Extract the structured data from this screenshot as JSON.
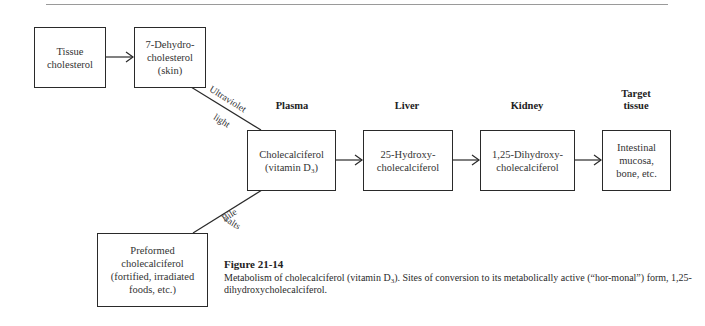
{
  "diagram": {
    "column_headers": {
      "plasma": "Plasma",
      "liver": "Liver",
      "kidney": "Kidney",
      "target_line1": "Target",
      "target_line2": "tissue"
    },
    "nodes": {
      "tissue_cholesterol": {
        "line1": "Tissue",
        "line2": "cholesterol"
      },
      "dehydrocholesterol": {
        "line1": "7-Dehydro-",
        "line2": "cholesterol",
        "line3": "(skin)"
      },
      "cholecalciferol": {
        "line1": "Cholecalciferol",
        "line2_pre": "(vitamin D",
        "line2_sub": "3",
        "line2_post": ")"
      },
      "hydroxy25": {
        "line1": "25-Hydroxy-",
        "line2": "cholecalciferol"
      },
      "dihydroxy125": {
        "line1": "1,25-Dihydroxy-",
        "line2": "cholecalciferol"
      },
      "target_tissue": {
        "line1": "Intestinal",
        "line2": "mucosa,",
        "line3": "bone, etc."
      },
      "preformed": {
        "line1": "Preformed",
        "line2": "cholecalciferol",
        "line3": "(fortified, irradiated",
        "line4": "foods, etc.)"
      }
    },
    "edge_labels": {
      "uv_line1": "Ultraviolet",
      "uv_line2": "light",
      "bile_line1": "Bile",
      "bile_line2": "salts"
    },
    "edges": [
      {
        "from": "tissue_cholesterol",
        "to": "dehydrocholesterol",
        "arrow": true
      },
      {
        "from": "dehydrocholesterol",
        "to": "cholecalciferol",
        "label": "Ultraviolet light",
        "arrow": false
      },
      {
        "from": "preformed",
        "to": "cholecalciferol",
        "label": "Bile salts",
        "arrow": false
      },
      {
        "from": "cholecalciferol",
        "to": "hydroxy25",
        "arrow": true
      },
      {
        "from": "hydroxy25",
        "to": "dihydroxy125",
        "arrow": true
      },
      {
        "from": "dihydroxy125",
        "to": "target_tissue",
        "arrow": true
      }
    ]
  },
  "caption": {
    "figure_label": "Figure 21-14",
    "text_pre": "Metabolism of cholecalciferol (vitamin D",
    "text_sub": "3",
    "text_post": "). Sites of conversion to its metabolically active (“hor-monal”) form, 1,25-dihydroxycholecalciferol."
  }
}
